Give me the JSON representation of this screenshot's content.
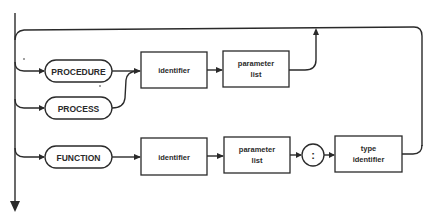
{
  "diagram": {
    "type": "syntax-diagram",
    "keywords": {
      "procedure": "PROCEDURE",
      "process": "PROCESS",
      "function": "FUNCTION"
    },
    "row1": {
      "identifier": "identifier",
      "parameter_list_line1": "parameter",
      "parameter_list_line2": "list"
    },
    "row2": {
      "identifier": "identifier",
      "parameter_list_line1": "parameter",
      "parameter_list_line2": "list",
      "colon": ":",
      "type_identifier_line1": "type",
      "type_identifier_line2": "identifier"
    },
    "colors": {
      "line": "#2a2a2a",
      "background": "#ffffff"
    }
  }
}
